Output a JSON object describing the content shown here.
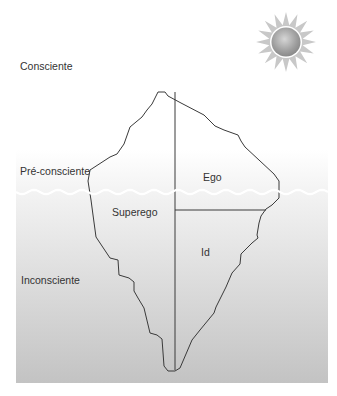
{
  "diagram": {
    "levels": {
      "conscious": "Consciente",
      "preconscious": "Pré-consciente",
      "unconscious": "Inconsciente"
    },
    "regions": {
      "ego": "Ego",
      "superego": "Superego",
      "id": "Id"
    },
    "icons": {
      "sun": "sun-icon"
    },
    "colors": {
      "sky": "#ffffff",
      "water_top": "#f4f4f4",
      "water_bottom": "#c4c4c4",
      "outline": "#3a3a3a",
      "wave": "#ffffff",
      "sun_core": "#a9a9a9",
      "sun_rays": "#c9c9c9"
    }
  }
}
